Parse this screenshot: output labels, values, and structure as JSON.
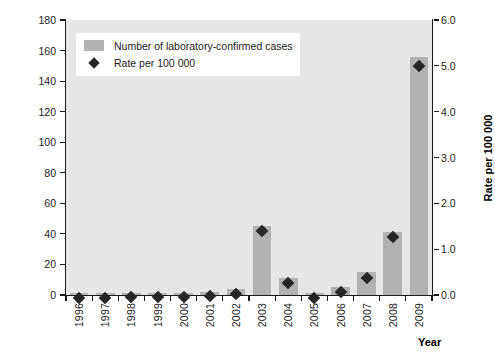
{
  "chart_data": {
    "type": "bar",
    "title": "",
    "xlabel": "Year",
    "ylabel": "Number of confirmed cases",
    "ylabel_secondary": "Rate per 100 000",
    "categories": [
      "1996",
      "1997",
      "1998",
      "1999",
      "2000",
      "2001",
      "2002",
      "2003",
      "2004",
      "2005",
      "2006",
      "2007",
      "2008",
      "2009"
    ],
    "ylim": [
      0,
      180
    ],
    "ylim_secondary": [
      0,
      6.0
    ],
    "yticks": [
      0,
      20,
      40,
      60,
      80,
      100,
      120,
      140,
      160,
      180
    ],
    "yticks_secondary": [
      "0.0",
      "1.0",
      "2.0",
      "3.0",
      "4.0",
      "5.0",
      "6.0"
    ],
    "grid": false,
    "legend_position": "upper-left",
    "series": [
      {
        "name": "Number of laboratory-confirmed cases",
        "type": "bar",
        "axis": "left",
        "color": "#b2b2b2",
        "values": [
          1,
          1,
          1,
          1,
          1,
          2,
          4,
          45,
          11,
          1,
          5,
          15,
          41,
          156
        ]
      },
      {
        "name": "Rate per 100 000",
        "type": "scatter",
        "marker": "diamond",
        "axis": "right",
        "color": "#262626",
        "values": [
          0.03,
          0.03,
          0.05,
          0.05,
          0.05,
          0.07,
          0.13,
          1.5,
          0.37,
          0.03,
          0.17,
          0.48,
          1.37,
          5.1
        ]
      }
    ]
  },
  "legend": {
    "items": [
      {
        "label": "Number of laboratory-confirmed cases",
        "marker": "bar-swatch"
      },
      {
        "label": "Rate per 100 000",
        "marker": "diamond-swatch"
      }
    ]
  },
  "colors": {
    "bar": "#b2b2b2",
    "marker": "#262626",
    "plot_background": "#e6e6e6",
    "axis": "#1a1a1a",
    "figure_background": "#ffffff"
  }
}
